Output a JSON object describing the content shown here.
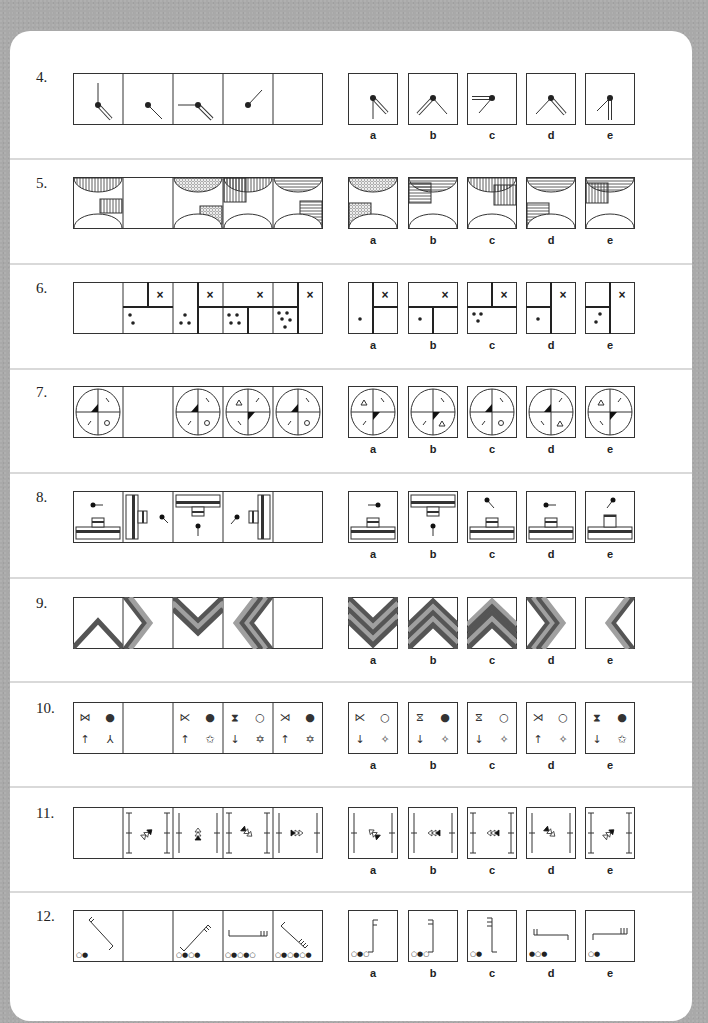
{
  "page": {
    "background_color": "#a9a9a9",
    "card_color": "#ffffff",
    "line_color": "#333333",
    "band_dark": "#555555",
    "band_light": "#a0a0a0"
  },
  "option_labels": [
    "a",
    "b",
    "c",
    "d",
    "e"
  ],
  "questions": [
    {
      "number": "4.",
      "topic": "clock-hands",
      "sequence": [
        {
          "cell": 1,
          "content": "dot with thin hand up and double hand down-right"
        },
        {
          "cell": 2,
          "content": "dot with thin hand down-right"
        },
        {
          "cell": 3,
          "content": "dot with thin hand left and double hand down-right"
        },
        {
          "cell": 4,
          "content": "dot with thin hand up-right"
        },
        {
          "cell": 5,
          "content": "blank (answer)"
        }
      ],
      "options": [
        {
          "label": "a",
          "content": "thin hand down, double hand down-right"
        },
        {
          "label": "b",
          "content": "double hand down-left, thin hand down-right"
        },
        {
          "label": "c",
          "content": "double hand left, thin hand down-left"
        },
        {
          "label": "d",
          "content": "thin hand down-left, double hand down-right"
        },
        {
          "label": "e",
          "content": "thin hand down-left, double hand down"
        }
      ]
    },
    {
      "number": "5.",
      "topic": "semicircles-and-hatched-squares",
      "sequence": [
        {
          "cell": 1,
          "content": "top semicircle vertical hatch, square vertical hatch right-middle"
        },
        {
          "cell": 2,
          "content": "blank (answer)"
        },
        {
          "cell": 3,
          "content": "top semicircle dotted, square dotted right-lower"
        },
        {
          "cell": 4,
          "content": "top semicircle vertical hatch, square vertical hatch left-upper"
        },
        {
          "cell": 5,
          "content": "top semicircle horizontal hatch, square horizontal hatch right-middle"
        }
      ],
      "options": [
        {
          "label": "a",
          "content": "dotted top semicircle, dotted square left-lower"
        },
        {
          "label": "b",
          "content": "horizontal top semicircle, horizontal square left-upper"
        },
        {
          "label": "c",
          "content": "vertical top semicircle, vertical square right-middle"
        },
        {
          "label": "d",
          "content": "horizontal top semicircle, horizontal square left-lower"
        },
        {
          "label": "e",
          "content": "horizontal top semicircle, vertical square left-upper"
        }
      ]
    },
    {
      "number": "6.",
      "topic": "dividers-dots-cross",
      "sequence": [
        {
          "cell": 1,
          "content": "blank (answer)"
        },
        {
          "cell": 2,
          "content": "2 dots, cross"
        },
        {
          "cell": 3,
          "content": "3 dots, cross"
        },
        {
          "cell": 4,
          "content": "4 dots, cross"
        },
        {
          "cell": 5,
          "content": "5 dots, cross"
        }
      ],
      "options": [
        {
          "label": "a",
          "content": "1 dot, cross"
        },
        {
          "label": "b",
          "content": "1 dot, cross"
        },
        {
          "label": "c",
          "content": "3 dots, cross"
        },
        {
          "label": "d",
          "content": "1 dot, cross"
        },
        {
          "label": "e",
          "content": "2 dots, cross"
        }
      ]
    },
    {
      "number": "7.",
      "topic": "quartered-ovals",
      "sequence": [
        {
          "cell": 1,
          "content": "oval, black wedge upper-left, circle lower-right"
        },
        {
          "cell": 2,
          "content": "blank (answer)"
        },
        {
          "cell": 3,
          "content": "oval, black wedge upper-left, circle lower-right"
        },
        {
          "cell": 4,
          "content": "oval, triangle upper-left, black wedge lower-right"
        },
        {
          "cell": 5,
          "content": "oval, black wedge upper-left, circle lower-right"
        }
      ],
      "options": [
        {
          "label": "a",
          "content": "triangle upper-left, black wedge lower-right"
        },
        {
          "label": "b",
          "content": "black wedge lower-right, triangle lower-right"
        },
        {
          "label": "c",
          "content": "black wedge upper-left, circle lower-right"
        },
        {
          "label": "d",
          "content": "black wedge upper-left, triangle lower-right"
        },
        {
          "label": "e",
          "content": "triangle upper-left, black wedge lower-right"
        }
      ]
    },
    {
      "number": "8.",
      "topic": "rotating-plate-and-pin",
      "sequence": [
        {
          "cell": 1,
          "content": "plate bottom, pin left"
        },
        {
          "cell": 2,
          "content": "plate left, pin diagonal"
        },
        {
          "cell": 3,
          "content": "plate top, pin down"
        },
        {
          "cell": 4,
          "content": "plate right, pin diagonal"
        },
        {
          "cell": 5,
          "content": "blank (answer)"
        }
      ],
      "options": [
        {
          "label": "a",
          "content": "plate bottom, pin right"
        },
        {
          "label": "b",
          "content": "plate top, pin down"
        },
        {
          "label": "c",
          "content": "plate bottom, pin upper-left"
        },
        {
          "label": "d",
          "content": "plate bottom, pin left"
        },
        {
          "label": "e",
          "content": "plate bottom, pin upper-right"
        }
      ]
    },
    {
      "number": "9.",
      "topic": "chevron-bands",
      "sequence": [
        {
          "cell": 1,
          "content": "1-band chevron up"
        },
        {
          "cell": 2,
          "content": "2-band chevron right"
        },
        {
          "cell": 3,
          "content": "3-band chevron down"
        },
        {
          "cell": 4,
          "content": "4-band chevron left"
        },
        {
          "cell": 5,
          "content": "blank (answer)"
        }
      ],
      "options": [
        {
          "label": "a",
          "content": "chevron down"
        },
        {
          "label": "b",
          "content": "chevron up"
        },
        {
          "label": "c",
          "content": "chevron up"
        },
        {
          "label": "d",
          "content": "chevron right"
        },
        {
          "label": "e",
          "content": "chevron left"
        }
      ]
    },
    {
      "number": "10.",
      "topic": "four-symbol-grid",
      "sequence": [
        {
          "cell": 1,
          "symbols": [
            "⋈",
            "●",
            "↑",
            "⅄"
          ]
        },
        {
          "cell": 2,
          "symbols": []
        },
        {
          "cell": 3,
          "symbols": [
            "⋉",
            "●",
            "↑",
            "✩"
          ]
        },
        {
          "cell": 4,
          "symbols": [
            "⧗",
            "○",
            "↓",
            "✡"
          ]
        },
        {
          "cell": 5,
          "symbols": [
            "⋊",
            "●",
            "↑",
            "✡"
          ]
        }
      ],
      "options": [
        {
          "label": "a",
          "symbols": [
            "⋉",
            "○",
            "↓",
            "✧"
          ]
        },
        {
          "label": "b",
          "symbols": [
            "⧖",
            "●",
            "↓",
            "✧"
          ]
        },
        {
          "label": "c",
          "symbols": [
            "⧖",
            "○",
            "↓",
            "✧"
          ]
        },
        {
          "label": "d",
          "symbols": [
            "⋊",
            "○",
            "↑",
            "✧"
          ]
        },
        {
          "label": "e",
          "symbols": [
            "⧗",
            "●",
            "↓",
            "✩"
          ]
        }
      ]
    },
    {
      "number": "11.",
      "topic": "triangle-arrows-between-bars",
      "sequence": [
        {
          "cell": 1,
          "content": "blank (answer)"
        },
        {
          "cell": 2,
          "content": "I-bars, arrows pointing up-right"
        },
        {
          "cell": 3,
          "content": "plain bars, arrows pointing down"
        },
        {
          "cell": 4,
          "content": "I-bars, arrows pointing up-left"
        },
        {
          "cell": 5,
          "content": "plain bars, arrows pointing left"
        }
      ],
      "options": [
        {
          "label": "a",
          "content": "plain bars, arrows down-right"
        },
        {
          "label": "b",
          "content": "plain bars, arrows right"
        },
        {
          "label": "c",
          "content": "I-bars, arrows right"
        },
        {
          "label": "d",
          "content": "plain bars, arrows up-left"
        },
        {
          "label": "e",
          "content": "I-bars, arrows up-right"
        }
      ]
    },
    {
      "number": "12.",
      "topic": "hooks-and-circle-counters",
      "sequence": [
        {
          "cell": 1,
          "circles": "○●"
        },
        {
          "cell": 2,
          "circles": ""
        },
        {
          "cell": 3,
          "circles": "○●○●"
        },
        {
          "cell": 4,
          "circles": "○●○●○"
        },
        {
          "cell": 5,
          "circles": "○●○●○●"
        }
      ],
      "options": [
        {
          "label": "a",
          "circles": "○●○"
        },
        {
          "label": "b",
          "circles": "○●○"
        },
        {
          "label": "c",
          "circles": "○●"
        },
        {
          "label": "d",
          "circles": "●○●"
        },
        {
          "label": "e",
          "circles": "○●"
        }
      ]
    }
  ]
}
